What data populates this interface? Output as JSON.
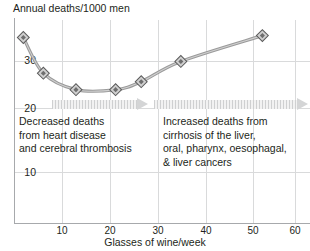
{
  "chart_data": {
    "type": "line",
    "title": "",
    "ylabel": "Annual deaths/1000 men",
    "xlabel": "Glasses of wine/week",
    "xlim": [
      0,
      63
    ],
    "ylim": [
      5,
      37
    ],
    "xticks": [
      10,
      20,
      30,
      40,
      50,
      60
    ],
    "yticks": [
      10,
      20,
      30
    ],
    "grid": true,
    "legend": "none",
    "marker": "diamond",
    "line_color": "#8c8c8c",
    "x": [
      1.7,
      6,
      13,
      21.5,
      27,
      35.5,
      53
    ],
    "values": [
      35,
      27.4,
      23.9,
      23.9,
      25.6,
      29.9,
      35.4
    ],
    "series": [
      {
        "name": "Annual deaths per 1000 men",
        "x": [
          1.7,
          6,
          13,
          21.5,
          27,
          35.5,
          53
        ],
        "values": [
          35,
          27.4,
          23.9,
          23.9,
          25.6,
          29.9,
          35.4
        ]
      }
    ],
    "annotations": [
      {
        "id": "left-annotation",
        "lines": [
          "Decreased deaths",
          "from heart disease",
          "and cerebral thrombosis"
        ],
        "arrow": "right"
      },
      {
        "id": "right-annotation",
        "lines": [
          "Increased deaths from",
          "cirrhosis of the liver,",
          "oral,  pharynx, oesophagal,",
          "& liver cancers"
        ],
        "arrow": "right"
      }
    ]
  },
  "axes": {
    "y_title": "Annual deaths/1000 men",
    "x_title": "Glasses of wine/week",
    "y_ticks": [
      "30",
      "20",
      "10"
    ],
    "x_ticks": [
      "10",
      "20",
      "30",
      "40",
      "50",
      "60"
    ]
  },
  "annotation_left": {
    "line1": "Decreased deaths",
    "line2": "from heart disease",
    "line3": "and cerebral thrombosis"
  },
  "annotation_right": {
    "line1": "Increased deaths from",
    "line2": "cirrhosis of the liver,",
    "line3": "oral,  pharynx, oesophagal,",
    "line4": "& liver cancers"
  },
  "colors": {
    "line": "#8c8c8c",
    "grid": "#d9dadb",
    "axis": "#a7a9ac",
    "text": "#231f20",
    "arrow": "#d4d5d6"
  }
}
